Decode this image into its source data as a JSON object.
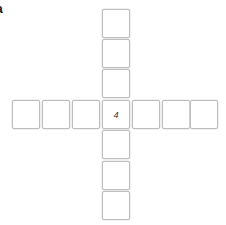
{
  "panel_label": "a",
  "grid": {
    "shape": "cross",
    "center_value": "4",
    "cells": [
      {
        "id": "up-3",
        "value": ""
      },
      {
        "id": "up-2",
        "value": ""
      },
      {
        "id": "up-1",
        "value": ""
      },
      {
        "id": "left-3",
        "value": ""
      },
      {
        "id": "left-2",
        "value": ""
      },
      {
        "id": "left-1",
        "value": ""
      },
      {
        "id": "center",
        "value": "4"
      },
      {
        "id": "right-1",
        "value": ""
      },
      {
        "id": "right-2",
        "value": ""
      },
      {
        "id": "right-3",
        "value": ""
      },
      {
        "id": "down-1",
        "value": ""
      },
      {
        "id": "down-2",
        "value": ""
      },
      {
        "id": "down-3",
        "value": ""
      }
    ]
  }
}
